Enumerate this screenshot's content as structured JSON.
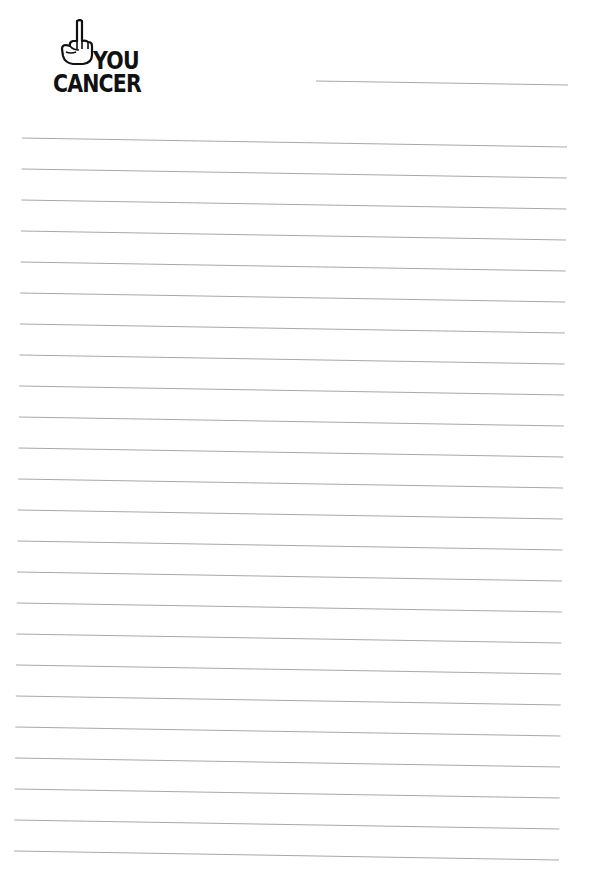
{
  "logo": {
    "icon": "raised-middle-finger-hand-icon",
    "line1": "YOU",
    "line2": "CANCER"
  },
  "header_line": {
    "x1": 316,
    "y1": 81,
    "x2": 568,
    "y2": 85
  },
  "ruled_lines": {
    "count": 24,
    "color": "#a8a8a8",
    "left_x_top": 22,
    "left_x_bottom": 14,
    "right_x_top": 567,
    "right_x_bottom": 559,
    "first_y_left": 138,
    "spacing": 31,
    "slope_drop": 9
  }
}
